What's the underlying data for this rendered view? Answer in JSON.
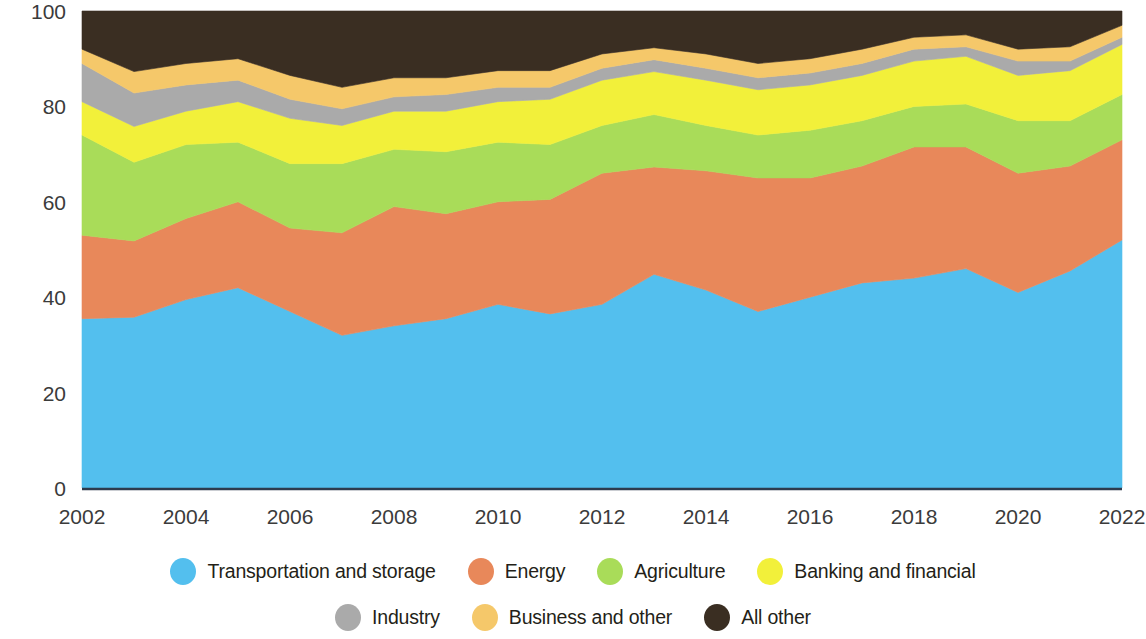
{
  "chart_data": {
    "type": "area",
    "title": "",
    "subtitle": "",
    "xlabel": "",
    "ylabel": "",
    "stacked": true,
    "percent": true,
    "grid": false,
    "legend_position": "bottom",
    "xlim": [
      2002,
      2022
    ],
    "ylim": [
      0,
      100
    ],
    "ytick_labels": [
      "0",
      "20",
      "40",
      "60",
      "80",
      "100"
    ],
    "yticks": [
      0,
      20,
      40,
      60,
      80,
      100
    ],
    "xtick_labels": [
      "2002",
      "2004",
      "2006",
      "2008",
      "2010",
      "2012",
      "2014",
      "2016",
      "2018",
      "2020",
      "2022"
    ],
    "xticks": [
      2002,
      2004,
      2006,
      2008,
      2010,
      2012,
      2014,
      2016,
      2018,
      2020,
      2022
    ],
    "x": [
      2002,
      2003,
      2004,
      2005,
      2006,
      2007,
      2008,
      2009,
      2010,
      2011,
      2012,
      2013,
      2014,
      2015,
      2016,
      2017,
      2018,
      2019,
      2020,
      2021,
      2022
    ],
    "series": [
      {
        "name": "Transportation and storage",
        "color": "#53BFEE",
        "values": [
          35.5,
          35.8,
          39.5,
          42.0,
          37.0,
          32.0,
          34.0,
          35.5,
          38.5,
          36.5,
          38.5,
          44.8,
          41.5,
          37.0,
          40.0,
          43.0,
          44.0,
          46.0,
          41.0,
          45.5,
          52.0
        ]
      },
      {
        "name": "Energy",
        "color": "#E8885A",
        "values": [
          17.5,
          16.0,
          17.0,
          18.0,
          17.5,
          21.5,
          25.0,
          22.0,
          21.5,
          24.0,
          27.5,
          22.5,
          25.0,
          28.0,
          25.0,
          24.5,
          27.5,
          25.5,
          25.0,
          22.0,
          21.0
        ]
      },
      {
        "name": "Agriculture",
        "color": "#A9DC59",
        "values": [
          21.0,
          16.5,
          15.5,
          12.5,
          13.5,
          14.5,
          12.0,
          13.0,
          12.5,
          11.5,
          10.0,
          11.0,
          9.5,
          9.0,
          10.0,
          9.5,
          8.5,
          9.0,
          11.0,
          9.5,
          9.5
        ]
      },
      {
        "name": "Banking and financial",
        "color": "#F2F03A",
        "values": [
          7.0,
          7.5,
          7.0,
          8.5,
          9.5,
          8.0,
          8.0,
          8.5,
          8.5,
          9.5,
          9.5,
          9.0,
          9.5,
          9.5,
          9.5,
          9.5,
          9.5,
          10.0,
          9.5,
          10.5,
          10.5
        ]
      },
      {
        "name": "Industry",
        "color": "#AAAAAA",
        "values": [
          8.0,
          7.0,
          5.5,
          4.5,
          4.0,
          3.5,
          3.0,
          3.5,
          3.0,
          2.5,
          2.5,
          2.5,
          2.5,
          2.5,
          2.5,
          2.5,
          2.5,
          2.0,
          3.0,
          2.0,
          1.5
        ]
      },
      {
        "name": "Business and other",
        "color": "#F5C86A",
        "values": [
          3.0,
          4.5,
          4.5,
          4.5,
          5.0,
          4.5,
          4.0,
          3.5,
          3.5,
          3.5,
          3.0,
          2.5,
          3.0,
          3.0,
          3.0,
          3.0,
          2.5,
          2.5,
          2.5,
          3.0,
          2.5
        ]
      },
      {
        "name": "All other",
        "color": "#3A2E22",
        "values": [
          8.0,
          12.7,
          11.0,
          10.0,
          13.5,
          16.0,
          14.0,
          14.0,
          12.5,
          12.5,
          9.0,
          7.7,
          9.0,
          11.0,
          10.0,
          8.0,
          5.5,
          5.0,
          8.0,
          7.5,
          3.0
        ]
      }
    ]
  },
  "legend": {
    "rows": [
      [
        {
          "label": "Transportation and storage",
          "color": "#53BFEE",
          "icon": "legend-dot-icon"
        },
        {
          "label": "Energy",
          "color": "#E8885A",
          "icon": "legend-dot-icon"
        },
        {
          "label": "Agriculture",
          "color": "#A9DC59",
          "icon": "legend-dot-icon"
        },
        {
          "label": "Banking and financial",
          "color": "#F2F03A",
          "icon": "legend-dot-icon"
        }
      ],
      [
        {
          "label": "Industry",
          "color": "#AAAAAA",
          "icon": "legend-dot-icon"
        },
        {
          "label": "Business and other",
          "color": "#F5C86A",
          "icon": "legend-dot-icon"
        },
        {
          "label": "All other",
          "color": "#3A2E22",
          "icon": "legend-dot-icon"
        }
      ]
    ]
  },
  "axes": {
    "baseline_color": "#2d3b4e",
    "tick_text_color": "#3b3b3b"
  }
}
